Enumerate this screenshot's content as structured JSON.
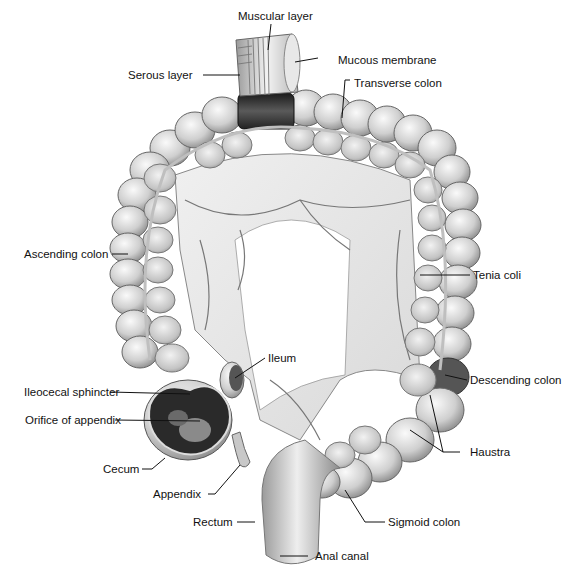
{
  "figure": {
    "colors": {
      "background": "#ffffff",
      "tissue_light": "#e6e6e6",
      "tissue_mid": "#bdbdbd",
      "tissue_dark": "#3a3a3a",
      "line": "#111111"
    },
    "labels": {
      "muscular_layer": "Muscular layer",
      "mucous_membrane": "Mucous membrane",
      "serous_layer": "Serous layer",
      "transverse_colon": "Transverse colon",
      "ascending_colon": "Ascending colon",
      "tenia_coli": "Tenia coli",
      "ileum": "Ileum",
      "descending_colon": "Descending colon",
      "ileocecal_sphincter": "Ileocecal sphincter",
      "orifice_of_appendix": "Orifice of appendix",
      "haustra": "Haustra",
      "cecum": "Cecum",
      "appendix": "Appendix",
      "rectum": "Rectum",
      "sigmoid_colon": "Sigmoid colon",
      "anal_canal": "Anal canal"
    }
  }
}
